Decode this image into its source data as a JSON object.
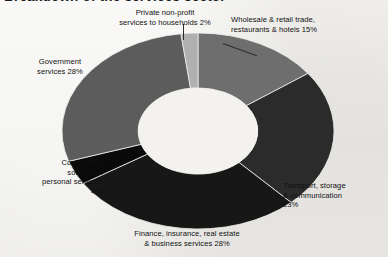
{
  "title": "Breakdown of the services sector",
  "chart_data": {
    "type": "pie",
    "variant": "donut",
    "title": "Breakdown of the services sector",
    "units": "percent",
    "total": 100,
    "hole_ratio": 0.44,
    "start_angle_deg": 0,
    "direction": "clockwise",
    "legend": "none",
    "grid": false,
    "labels": [
      "Wholesale & retail trade, restaurants & hotels",
      "Transport, storage & communication",
      "Finance, insurance, real estate & business services",
      "Community, social and personal services",
      "Government services",
      "Private non-profit services to households"
    ],
    "values": [
      15,
      23,
      28,
      4,
      28,
      2
    ],
    "colors": [
      "#6e6e6e",
      "#2b2b2b",
      "#171717",
      "#0a0a0a",
      "#5c5c5c",
      "#b0b0b0"
    ],
    "slices": [
      {
        "name": "wholesale-retail-trade",
        "label": "Wholesale & retail trade,\nrestaurants & hotels 15%",
        "label_text": "Wholesale & retail trade, restaurants & hotels",
        "value": 15,
        "value_text": "15%",
        "color": "#6e6e6e"
      },
      {
        "name": "transport-storage-communication",
        "label": "Transport, storage\n& communication\n23%",
        "label_text": "Transport, storage & communication",
        "value": 23,
        "value_text": "23%",
        "color": "#2b2b2b"
      },
      {
        "name": "finance-insurance-real-estate",
        "label": "Finance, insurance, real estate\n& business services 28%",
        "label_text": "Finance, insurance, real estate & business services",
        "value": 28,
        "value_text": "28%",
        "color": "#171717"
      },
      {
        "name": "community-social-personal-services",
        "label": "Community,\nsocial and\npersonal services\n4%",
        "label_text": "Community, social and personal services",
        "value": 4,
        "value_text": "4%",
        "color": "#0a0a0a"
      },
      {
        "name": "government-services",
        "label": "Government\nservices 28%",
        "label_text": "Government services",
        "value": 28,
        "value_text": "28%",
        "color": "#5c5c5c"
      },
      {
        "name": "private-non-profit-services",
        "label": "Private non-profit\nservices to households 2%",
        "label_text": "Private non-profit services to households",
        "value": 2,
        "value_text": "2%",
        "color": "#b0b0b0"
      }
    ],
    "background_color": "#efeeea",
    "hole_color": "#f3f2ee",
    "text_color": "#111111"
  }
}
